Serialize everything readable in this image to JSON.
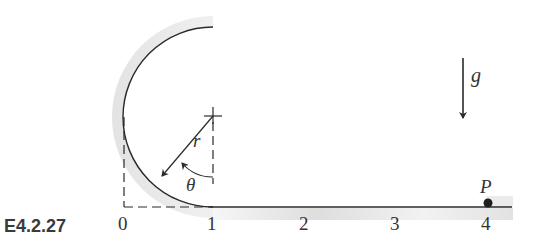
{
  "figure": {
    "label": "E4.2.27",
    "axis_ticks": [
      "0",
      "1",
      "2",
      "3",
      "4"
    ],
    "radius_label": "r",
    "angle_label": "θ",
    "gravity_label": "g",
    "point_label": "P"
  },
  "colors": {
    "line": "#2a2a2a",
    "shade": "#e4e4e4",
    "label": "#333333"
  }
}
